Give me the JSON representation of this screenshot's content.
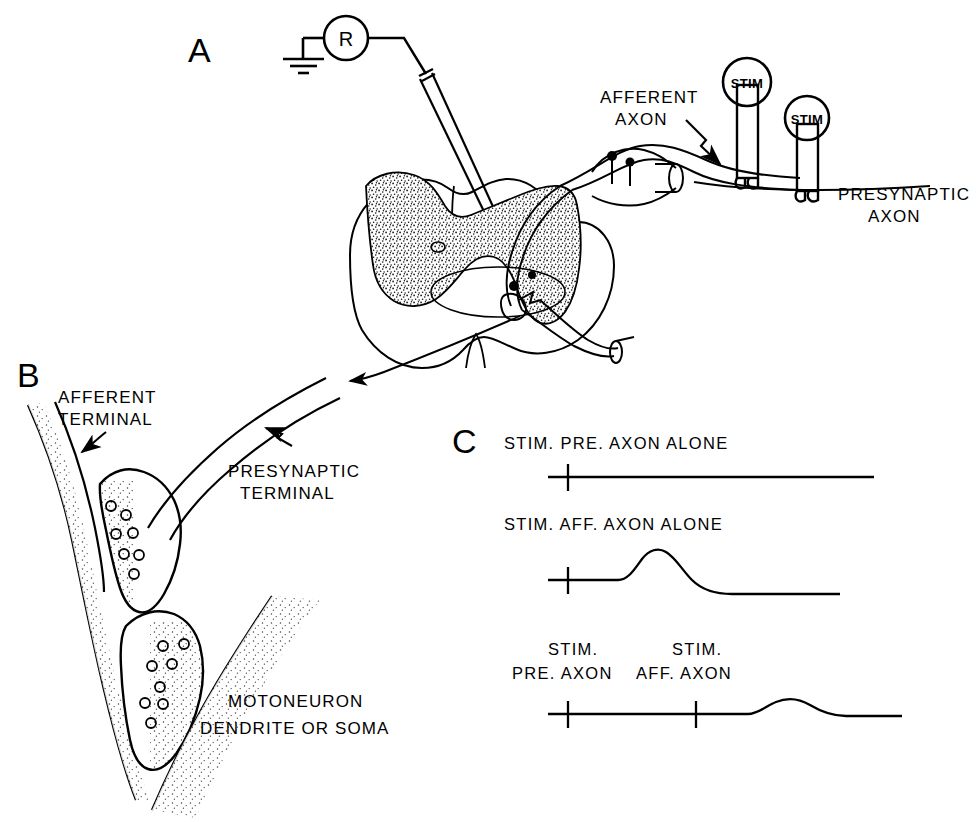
{
  "figure": {
    "background_color": "#ffffff",
    "ink_color": "#000000",
    "stipple_color": "#1a1a1a"
  },
  "panels": {
    "a": {
      "letter": "A",
      "caption_kind": "spinal cord cross-section with recording and stimulating electrodes",
      "labels": {
        "afferent_axon_line1": "AFFERENT",
        "afferent_axon_line2": "AXON",
        "presynaptic_axon_line1": "PRESYNAPTIC",
        "presynaptic_axon_line2": "AXON"
      },
      "electrodes": {
        "recording_label": "R",
        "recording_name": "recording-amplifier",
        "ground_name": "ground-symbol",
        "stim_afferent_label": "STIM",
        "stim_presynaptic_label": "STIM"
      }
    },
    "b": {
      "letter": "B",
      "caption_kind": "enlarged synaptic terminals",
      "labels": {
        "afferent_terminal_line1": "AFFERENT",
        "afferent_terminal_line2": "TERMINAL",
        "presynaptic_terminal_line1": "PRESYNAPTIC",
        "presynaptic_terminal_line2": "TERMINAL",
        "motoneuron_line1": "MOTONEURON",
        "motoneuron_line2": "DENDRITE OR SOMA"
      }
    },
    "c": {
      "letter": "C",
      "caption_kind": "intracellular recordings",
      "traces": [
        {
          "id": "trace-pre-alone",
          "title": "STIM. PRE. AXON ALONE",
          "title_lines": [
            "STIM. PRE. AXON ALONE"
          ],
          "stim_marks": 1,
          "response": "none",
          "response_amplitude": 0
        },
        {
          "id": "trace-aff-alone",
          "title": "STIM. AFF. AXON ALONE",
          "title_lines": [
            "STIM. AFF. AXON ALONE"
          ],
          "stim_marks": 1,
          "response": "epsp",
          "response_amplitude": 29
        },
        {
          "id": "trace-pre-then-aff",
          "title": "STIM. PRE. AXON   STIM. AFF. AXON",
          "title_lines": [
            "STIM.",
            "PRE. AXON",
            "STIM.",
            "AFF. AXON"
          ],
          "mark_labels": [
            {
              "line1": "STIM.",
              "line2": "PRE. AXON"
            },
            {
              "line1": "STIM.",
              "line2": "AFF. AXON"
            }
          ],
          "stim_marks": 2,
          "response": "epsp-reduced",
          "response_amplitude": 12
        }
      ]
    }
  }
}
